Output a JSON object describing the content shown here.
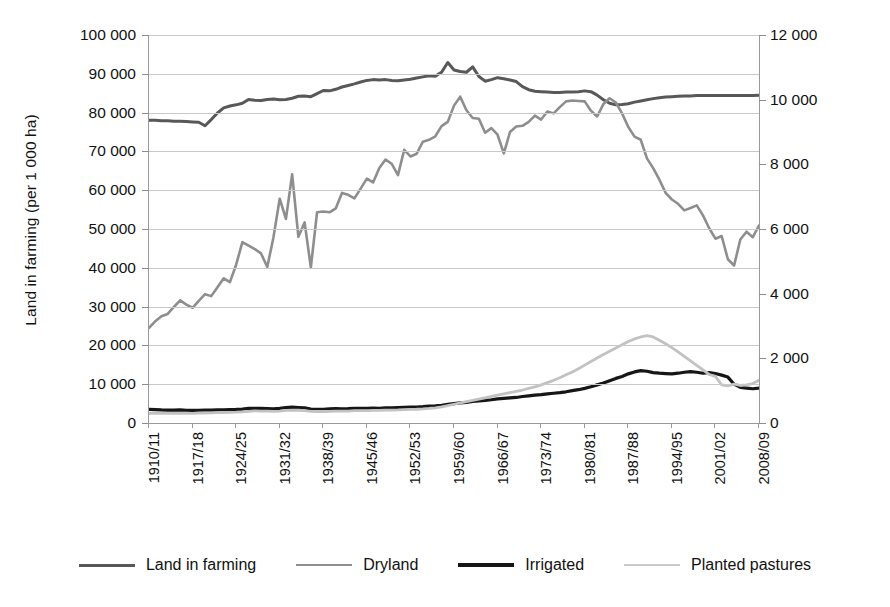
{
  "chart_data": {
    "type": "line",
    "title": "",
    "ylabel": "Land in farming (per 1 000 ha)",
    "ylabel_right": "",
    "xlabel": "",
    "grid": true,
    "legend_position": "bottom",
    "ylim": [
      0,
      100000
    ],
    "ylim_right": [
      0,
      12000
    ],
    "yticks": [
      "0",
      "10 000",
      "20 000",
      "30 000",
      "40 000",
      "50 000",
      "60 000",
      "70 000",
      "80 000",
      "90 000",
      "100 000"
    ],
    "ytick_values": [
      0,
      10000,
      20000,
      30000,
      40000,
      50000,
      60000,
      70000,
      80000,
      90000,
      100000
    ],
    "yticks_right": [
      "0",
      "2 000",
      "4 000",
      "6 000",
      "8 000",
      "10 000",
      "12 000"
    ],
    "ytick_values_right": [
      0,
      2000,
      4000,
      6000,
      8000,
      10000,
      12000
    ],
    "xticks": [
      "1910/11",
      "1917/18",
      "1924/25",
      "1931/32",
      "1938/39",
      "1945/46",
      "1952/53",
      "1959/60",
      "1966/67",
      "1973/74",
      "1980/81",
      "1987/88",
      "1994/95",
      "2001/02",
      "2008/09"
    ],
    "xtick_indices": [
      0,
      7,
      14,
      21,
      28,
      35,
      42,
      49,
      56,
      63,
      70,
      77,
      84,
      91,
      98
    ],
    "x_start_year": 1910,
    "x_end_year": 2008,
    "n_points": 99,
    "series": [
      {
        "name": "Land in farming",
        "color": "#585858",
        "width": 3.0,
        "axis": "left",
        "values": [
          78000,
          78000,
          77900,
          77900,
          77800,
          77800,
          77700,
          77600,
          77500,
          76600,
          78200,
          79900,
          81200,
          81700,
          82000,
          82400,
          83400,
          83200,
          83100,
          83400,
          83500,
          83300,
          83400,
          83700,
          84200,
          84300,
          84100,
          84900,
          85700,
          85600,
          86000,
          86600,
          87000,
          87400,
          87900,
          88300,
          88500,
          88400,
          88500,
          88300,
          88200,
          88400,
          88600,
          88900,
          89200,
          89500,
          89400,
          90400,
          92900,
          91000,
          90600,
          90400,
          91800,
          89300,
          88100,
          88500,
          89000,
          88700,
          88400,
          88000,
          86700,
          85900,
          85500,
          85400,
          85300,
          85200,
          85200,
          85300,
          85300,
          85400,
          85600,
          85400,
          84500,
          83300,
          82400,
          82000,
          82100,
          82300,
          82700,
          83000,
          83300,
          83600,
          83800,
          84000,
          84100,
          84200,
          84300,
          84300,
          84400,
          84400,
          84400,
          84400,
          84400,
          84400,
          84400,
          84400,
          84400,
          84400,
          84500
        ]
      },
      {
        "name": "Dryland",
        "color": "#8e8e8e",
        "width": 2.6,
        "axis": "left",
        "values": [
          24500,
          26200,
          27500,
          28100,
          29900,
          31600,
          30500,
          29700,
          31500,
          33200,
          32700,
          35000,
          37300,
          36300,
          40800,
          46600,
          45700,
          44800,
          43700,
          40200,
          47900,
          57800,
          52600,
          64100,
          48000,
          51700,
          40100,
          54300,
          54500,
          54300,
          55300,
          59300,
          58800,
          57900,
          60400,
          63000,
          62000,
          65700,
          67900,
          66800,
          63900,
          70400,
          68700,
          69400,
          72500,
          73000,
          73900,
          76500,
          77600,
          81800,
          84100,
          80600,
          78600,
          78400,
          74800,
          76000,
          74300,
          69500,
          75000,
          76400,
          76600,
          77600,
          79200,
          78200,
          80300,
          79800,
          81400,
          82900,
          83100,
          83000,
          82900,
          80500,
          79000,
          82200,
          83700,
          82600,
          79800,
          76300,
          73800,
          73000,
          68200,
          65700,
          62700,
          59300,
          57600,
          56500,
          54800,
          55400,
          56100,
          53500,
          50200,
          47500,
          48200,
          42200,
          40600,
          47300,
          49300,
          47900,
          50900
        ]
      },
      {
        "name": "Irrigated",
        "color": "#161616",
        "width": 3.2,
        "axis": "right",
        "values": [
          420,
          415,
          405,
          400,
          400,
          405,
          395,
          390,
          395,
          400,
          400,
          405,
          410,
          415,
          420,
          430,
          450,
          455,
          450,
          445,
          435,
          450,
          480,
          490,
          480,
          470,
          430,
          420,
          420,
          435,
          445,
          440,
          445,
          455,
          450,
          455,
          460,
          455,
          470,
          465,
          475,
          485,
          490,
          495,
          505,
          520,
          530,
          550,
          575,
          600,
          620,
          640,
          665,
          680,
          700,
          720,
          745,
          760,
          775,
          790,
          820,
          840,
          860,
          875,
          900,
          920,
          940,
          965,
          1000,
          1030,
          1070,
          1120,
          1180,
          1240,
          1310,
          1380,
          1440,
          1520,
          1580,
          1620,
          1600,
          1560,
          1540,
          1530,
          1520,
          1540,
          1570,
          1590,
          1570,
          1540,
          1560,
          1530,
          1480,
          1420,
          1200,
          1100,
          1080,
          1060,
          1080,
          1030
        ]
      },
      {
        "name": "Planted pastures",
        "color": "#c2c2c2",
        "width": 2.8,
        "axis": "right",
        "values": [
          300,
          300,
          300,
          300,
          300,
          300,
          300,
          300,
          305,
          310,
          315,
          320,
          325,
          330,
          335,
          345,
          360,
          375,
          370,
          365,
          360,
          370,
          390,
          400,
          395,
          385,
          360,
          355,
          355,
          360,
          365,
          365,
          370,
          380,
          380,
          385,
          390,
          390,
          400,
          400,
          405,
          415,
          420,
          425,
          435,
          450,
          470,
          500,
          540,
          580,
          620,
          660,
          700,
          740,
          780,
          820,
          860,
          900,
          940,
          980,
          1020,
          1070,
          1120,
          1180,
          1250,
          1320,
          1400,
          1490,
          1580,
          1680,
          1790,
          1900,
          2010,
          2120,
          2220,
          2320,
          2420,
          2520,
          2600,
          2660,
          2700,
          2660,
          2560,
          2450,
          2330,
          2200,
          2060,
          1920,
          1780,
          1640,
          1500,
          1440,
          1180,
          1150,
          1200,
          1160,
          1180,
          1220,
          1320,
          1340
        ]
      }
    ]
  },
  "legend": {
    "items": [
      {
        "label": "Land in farming",
        "color": "#585858",
        "thickness": "3px"
      },
      {
        "label": "Dryland",
        "color": "#8e8e8e",
        "thickness": "2px"
      },
      {
        "label": "Irrigated",
        "color": "#161616",
        "thickness": "4px"
      },
      {
        "label": "Planted pastures",
        "color": "#c9c9c9",
        "thickness": "2px"
      }
    ]
  }
}
